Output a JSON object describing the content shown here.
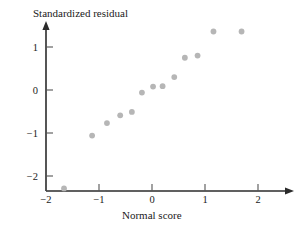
{
  "chart_data": {
    "type": "scatter",
    "title": "",
    "xlabel": "Normal score",
    "ylabel": "Standardized residual",
    "xlim": [
      -2.2,
      2.4
    ],
    "ylim": [
      -2.6,
      1.75
    ],
    "xticks": [
      -2,
      -1,
      0,
      1,
      2
    ],
    "xtick_labels": [
      "−2",
      "−1",
      "0",
      "1",
      "2"
    ],
    "yticks": [
      1,
      0,
      -1,
      -2
    ],
    "ytick_labels": [
      "1",
      "0",
      "−1",
      "−2"
    ],
    "grid": false,
    "legend": false,
    "legend_position": "none",
    "point_color": "#b6b6b6",
    "axis_color": "#2b2b2b",
    "n_points": 14,
    "x": [
      -1.66,
      -1.13,
      -0.85,
      -0.6,
      -0.38,
      -0.19,
      0.02,
      0.2,
      0.42,
      0.62,
      0.86,
      1.16,
      1.69
    ],
    "y": [
      -2.29,
      -1.06,
      -0.77,
      -0.59,
      -0.51,
      -0.06,
      0.08,
      0.09,
      0.3,
      0.75,
      0.8,
      1.36,
      1.36
    ],
    "points": [
      {
        "x": -1.66,
        "y": -2.29
      },
      {
        "x": -1.13,
        "y": -1.06
      },
      {
        "x": -0.85,
        "y": -0.77
      },
      {
        "x": -0.6,
        "y": -0.59
      },
      {
        "x": -0.38,
        "y": -0.51
      },
      {
        "x": -0.19,
        "y": -0.06
      },
      {
        "x": 0.02,
        "y": 0.08
      },
      {
        "x": 0.2,
        "y": 0.09
      },
      {
        "x": 0.42,
        "y": 0.3
      },
      {
        "x": 0.62,
        "y": 0.75
      },
      {
        "x": 0.86,
        "y": 0.8
      },
      {
        "x": 1.16,
        "y": 1.36
      },
      {
        "x": 1.69,
        "y": 1.36
      }
    ]
  },
  "labels": {
    "y_axis_title": "Standardized residual",
    "x_axis_title": "Normal score"
  }
}
